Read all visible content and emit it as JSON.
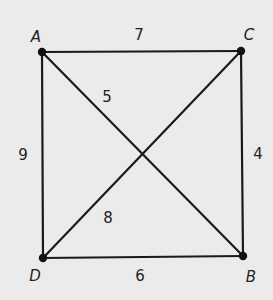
{
  "diagram": {
    "type": "graph",
    "background": "#ebebeb",
    "line_color": "#1a1a1a",
    "vertices": [
      {
        "id": "A",
        "label": "A",
        "x": 42,
        "y": 52,
        "label_x": 36,
        "label_y": 37
      },
      {
        "id": "C",
        "label": "C",
        "x": 241,
        "y": 51,
        "label_x": 249,
        "label_y": 35
      },
      {
        "id": "D",
        "label": "D",
        "x": 43,
        "y": 258,
        "label_x": 35,
        "label_y": 276
      },
      {
        "id": "B",
        "label": "B",
        "x": 243,
        "y": 256,
        "label_x": 251,
        "label_y": 277
      }
    ],
    "edges": [
      {
        "from": "A",
        "to": "C",
        "weight": "7",
        "label_x": 139,
        "label_y": 35
      },
      {
        "from": "A",
        "to": "D",
        "weight": "9",
        "label_x": 23,
        "label_y": 155
      },
      {
        "from": "C",
        "to": "B",
        "weight": "4",
        "label_x": 258,
        "label_y": 154
      },
      {
        "from": "D",
        "to": "B",
        "weight": "6",
        "label_x": 140,
        "label_y": 276
      },
      {
        "from": "A",
        "to": "B",
        "weight": "5",
        "label_x": 107,
        "label_y": 97
      },
      {
        "from": "D",
        "to": "C",
        "weight": "8",
        "label_x": 108,
        "label_y": 218
      }
    ]
  }
}
